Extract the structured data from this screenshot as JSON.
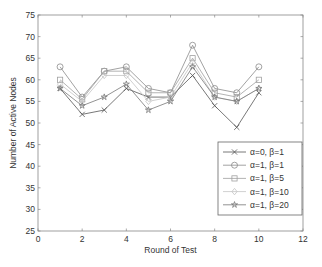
{
  "chart_data": {
    "type": "line",
    "title": "",
    "xlabel": "Round of Test",
    "ylabel": "Number of Active Nodes",
    "xlim": [
      0,
      12
    ],
    "ylim": [
      25,
      75
    ],
    "xticks": [
      0,
      2,
      4,
      6,
      8,
      10,
      12
    ],
    "yticks": [
      25,
      30,
      35,
      40,
      45,
      50,
      55,
      60,
      65,
      70,
      75
    ],
    "grid": false,
    "legend_position": "lower right",
    "x": [
      1,
      2,
      3,
      4,
      5,
      6,
      7,
      8,
      9,
      10
    ],
    "series": [
      {
        "name": "α=0, β=1",
        "marker": "x",
        "color": "#555555",
        "values": [
          58,
          52,
          53,
          58,
          56,
          56,
          61,
          54,
          49,
          57
        ]
      },
      {
        "name": "α=1, β=1",
        "marker": "circle",
        "color": "#8a8a8a",
        "values": [
          63,
          56,
          62,
          63,
          58,
          57,
          68,
          58,
          57,
          63
        ]
      },
      {
        "name": "α=1, β=5",
        "marker": "square",
        "color": "#a0a0a0",
        "values": [
          60,
          55.5,
          62,
          62,
          57,
          57,
          65,
          57,
          56,
          60
        ]
      },
      {
        "name": "α=1, β=10",
        "marker": "diamond",
        "color": "#c4c4c4",
        "values": [
          59,
          55,
          61,
          61,
          55,
          56,
          64,
          56,
          55,
          58
        ]
      },
      {
        "name": "α=1, β=20",
        "marker": "star",
        "color": "#777777",
        "values": [
          58,
          54,
          56,
          59,
          53,
          55,
          63,
          56,
          55,
          58
        ]
      }
    ]
  }
}
